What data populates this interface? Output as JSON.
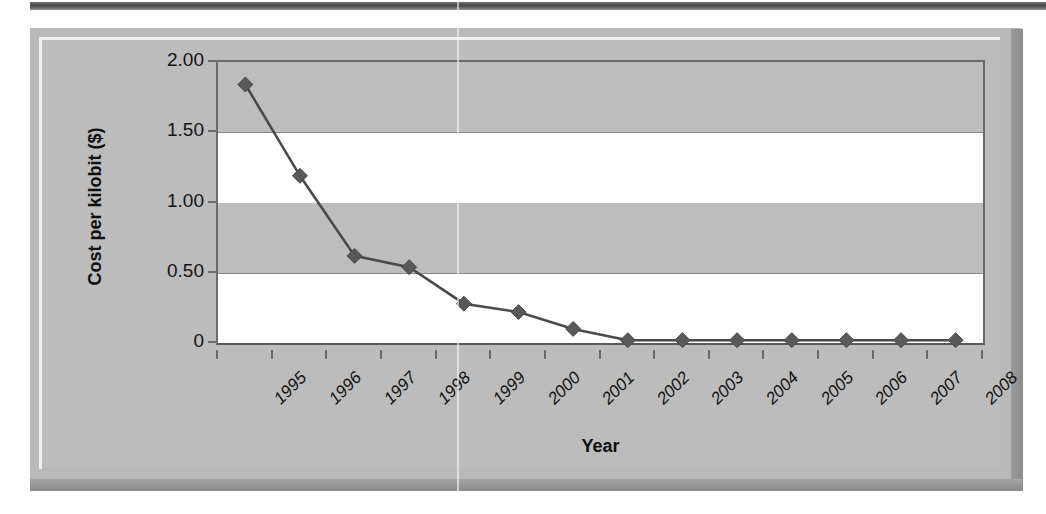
{
  "chart_data": {
    "type": "line",
    "title": "",
    "xlabel": "Year",
    "ylabel": "Cost per kilobit ($)",
    "categories": [
      "1995",
      "1996",
      "1997",
      "1998",
      "1999",
      "2000",
      "2001",
      "2002",
      "2003",
      "2004",
      "2005",
      "2006",
      "2007",
      "2008"
    ],
    "values": [
      1.84,
      1.19,
      0.62,
      0.54,
      0.28,
      0.22,
      0.1,
      0.02,
      0.02,
      0.02,
      0.02,
      0.02,
      0.02,
      0.02
    ],
    "series": [
      {
        "name": "Cost per kilobit",
        "values": [
          1.84,
          1.19,
          0.62,
          0.54,
          0.28,
          0.22,
          0.1,
          0.02,
          0.02,
          0.02,
          0.02,
          0.02,
          0.02,
          0.02
        ]
      }
    ],
    "ylim": [
      0,
      2.0
    ],
    "ytick_labels": [
      "2.00",
      "1.50",
      "1.00",
      "0.50",
      "0"
    ],
    "ytick_values": [
      2.0,
      1.5,
      1.0,
      0.5,
      0
    ],
    "grid": true,
    "legend": "none",
    "marker": "diamond",
    "line_color": "#4a4a4a",
    "marker_color": "#595959",
    "plot_background": "#ffffff",
    "band_color": "#bdbdbd",
    "frame_color": "#b9b9b9",
    "axis_color": "#6b6b6b",
    "text_color": "#111111"
  },
  "axes": {
    "y_title": "Cost per kilobit ($)",
    "x_title": "Year"
  }
}
